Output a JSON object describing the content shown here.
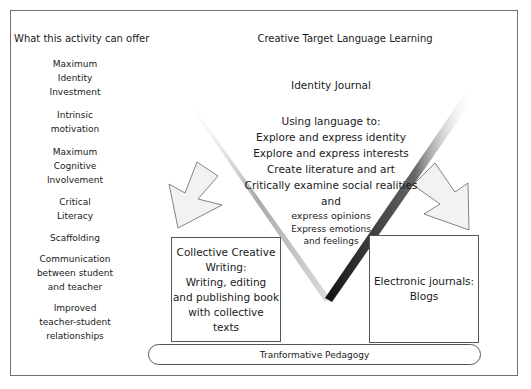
{
  "left_column": {
    "title": "What this activity can offer",
    "items": [
      {
        "lines": [
          "Maximum",
          "Identity",
          "Investment"
        ]
      },
      {
        "lines": [
          "Intrinsic",
          "motivation"
        ]
      },
      {
        "lines": [
          "Maximum",
          "Cognitive",
          "Involvement"
        ]
      },
      {
        "lines": [
          "Critical",
          "Literacy"
        ]
      },
      {
        "lines": [
          "Scaffolding"
        ]
      },
      {
        "lines": [
          "Communication",
          "between student",
          "and teacher"
        ]
      },
      {
        "lines": [
          "Improved",
          "teacher-student",
          "relationships"
        ]
      }
    ]
  },
  "main": {
    "title": "Creative Target Language Learning",
    "journal": {
      "title": "Identity Journal",
      "intro": "Using language to:",
      "uses": [
        "Explore and express identity",
        "Explore and express interests",
        "Create literature and art",
        "Critically examine social realities",
        "and",
        "express opinions"
      ],
      "uses_small": [
        "Express emotions",
        "and feelings"
      ]
    },
    "collective_box": {
      "lines": [
        "Collective Creative",
        "Writing:",
        "Writing, editing",
        "and publishing book",
        "with collective",
        "texts"
      ]
    },
    "blogs_box": {
      "lines": [
        "Electronic journals:",
        "Blogs"
      ]
    },
    "foundation": "Tranformative Pedagogy"
  },
  "colors": {
    "border": "#6f6f6f",
    "arrow_fill": "#f2f2f2",
    "arrow_stroke": "#666666",
    "v_right_edge": "#222222",
    "v_left_edge": "#9a9a9a"
  }
}
